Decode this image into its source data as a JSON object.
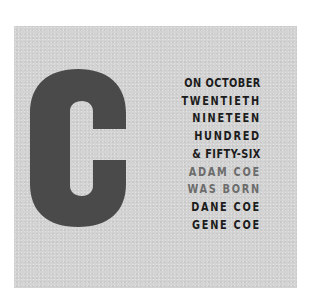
{
  "card": {
    "background_color": "#d3d3d3",
    "big_letter": "C",
    "big_letter_color": "#4a4a4a"
  },
  "text_lines": [
    {
      "text": "ON OCTOBER",
      "tone": "dark"
    },
    {
      "text": "TWENTIETH",
      "tone": "dark"
    },
    {
      "text": "NINETEEN",
      "tone": "dark"
    },
    {
      "text": "HUNDRED",
      "tone": "dark"
    },
    {
      "text": "& FIFTY-SIX",
      "tone": "dark"
    },
    {
      "text": "ADAM COE",
      "tone": "light"
    },
    {
      "text": "WAS BORN",
      "tone": "light"
    },
    {
      "text": "DANE COE",
      "tone": "dark"
    },
    {
      "text": "GENE COE",
      "tone": "dark"
    }
  ],
  "colors": {
    "dark_text": "#1c1c1c",
    "light_text": "#6c6c6c"
  }
}
